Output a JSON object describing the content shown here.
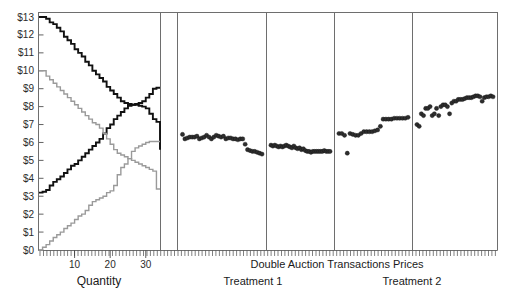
{
  "figure": {
    "title_caption": "Double Auction Transactions Prices",
    "treatment_left_label": "Treatment 1",
    "treatment_right_label": "Treatment 2",
    "quantity_axis_title": "Quantity",
    "colors": {
      "curve_black": "#111111",
      "curve_gray": "#9a9a9a",
      "point": "#2e2e2e",
      "frame": "#6e6e6e",
      "background": "#ffffff"
    }
  },
  "chart_data": {
    "type": "scatter",
    "title": "Double Auction Transactions Prices",
    "xlabel": "Quantity",
    "ylabel": "",
    "ylim": [
      0,
      13
    ],
    "grid": false,
    "legend": "none",
    "ytick_labels": [
      "$0",
      "$1",
      "$2",
      "$3",
      "$4",
      "$5",
      "$6",
      "$7",
      "$8",
      "$9",
      "$10",
      "$11",
      "$12",
      "$13"
    ],
    "ytick_values": [
      0,
      1,
      2,
      3,
      4,
      5,
      6,
      7,
      8,
      9,
      10,
      11,
      12,
      13
    ],
    "supply_demand_panel": {
      "type": "line",
      "xlabel": "Quantity",
      "xtick_labels": [
        "10",
        "20",
        "30"
      ],
      "xtick_values": [
        10,
        20,
        30
      ],
      "xlim": [
        0,
        34
      ],
      "series": [
        {
          "name": "Demand (black, treatment 1)",
          "color": "#111111",
          "style": "step",
          "x": [
            0,
            1,
            2,
            3,
            4,
            5,
            6,
            7,
            8,
            9,
            10,
            11,
            12,
            13,
            14,
            15,
            16,
            17,
            18,
            19,
            20,
            21,
            22,
            23,
            24,
            25,
            26,
            27,
            28,
            29,
            30,
            31,
            32,
            33
          ],
          "y": [
            13.0,
            13.0,
            12.9,
            12.7,
            12.6,
            12.4,
            12.2,
            11.9,
            11.7,
            11.5,
            11.2,
            11.0,
            10.8,
            10.5,
            10.3,
            10.0,
            9.8,
            9.6,
            9.4,
            9.1,
            8.9,
            8.7,
            8.5,
            8.3,
            8.2,
            8.15,
            8.1,
            8.1,
            8.05,
            8.0,
            7.9,
            7.6,
            7.3,
            7.15
          ]
        },
        {
          "name": "Supply (black, treatment 1)",
          "color": "#111111",
          "style": "step",
          "x": [
            0,
            1,
            2,
            3,
            4,
            5,
            6,
            7,
            8,
            9,
            10,
            11,
            12,
            13,
            14,
            15,
            16,
            17,
            18,
            19,
            20,
            21,
            22,
            23,
            24,
            25,
            26,
            27,
            28,
            29,
            30,
            31,
            32,
            33
          ],
          "y": [
            3.2,
            3.25,
            3.35,
            3.6,
            3.8,
            3.95,
            4.1,
            4.3,
            4.5,
            4.7,
            4.8,
            5.0,
            5.2,
            5.4,
            5.6,
            5.8,
            6.0,
            6.2,
            6.5,
            6.8,
            7.0,
            7.3,
            7.5,
            7.7,
            7.9,
            8.05,
            8.1,
            8.15,
            8.2,
            8.3,
            8.5,
            8.7,
            9.0,
            9.05
          ]
        },
        {
          "name": "Demand (gray, treatment 2)",
          "color": "#9a9a9a",
          "style": "step",
          "x": [
            0,
            1,
            2,
            3,
            4,
            5,
            6,
            7,
            8,
            9,
            10,
            11,
            12,
            13,
            14,
            15,
            16,
            17,
            18,
            19,
            20,
            21,
            22,
            23,
            24,
            25,
            26,
            27,
            28,
            29,
            30,
            31,
            32,
            33
          ],
          "y": [
            10.0,
            10.0,
            9.7,
            9.5,
            9.3,
            9.1,
            8.9,
            8.7,
            8.5,
            8.3,
            8.1,
            7.9,
            7.7,
            7.5,
            7.3,
            7.1,
            7.0,
            6.8,
            6.5,
            6.2,
            5.9,
            5.6,
            5.4,
            5.3,
            5.2,
            5.1,
            5.0,
            4.9,
            4.8,
            4.7,
            4.6,
            4.5,
            4.4,
            3.4
          ]
        },
        {
          "name": "Supply (gray, treatment 2)",
          "color": "#9a9a9a",
          "style": "step",
          "x": [
            0,
            1,
            2,
            3,
            4,
            5,
            6,
            7,
            8,
            9,
            10,
            11,
            12,
            13,
            14,
            15,
            16,
            17,
            18,
            19,
            20,
            21,
            22,
            23,
            24,
            25,
            26,
            27,
            28,
            29,
            30,
            31,
            32,
            33
          ],
          "y": [
            0.0,
            0.15,
            0.3,
            0.5,
            0.7,
            0.85,
            1.0,
            1.2,
            1.35,
            1.5,
            1.7,
            1.9,
            2.0,
            2.2,
            2.5,
            2.7,
            2.8,
            2.9,
            3.0,
            3.2,
            3.3,
            3.6,
            4.2,
            4.6,
            4.8,
            5.1,
            5.5,
            5.7,
            5.8,
            5.9,
            6.0,
            6.05,
            6.05,
            6.05
          ]
        }
      ]
    },
    "transaction_panels": [
      {
        "panel": 1,
        "group": "Treatment 1",
        "prices": [
          6.45,
          6.2,
          6.25,
          6.3,
          6.3,
          6.3,
          6.35,
          6.2,
          6.25,
          6.3,
          6.4,
          6.3,
          6.2,
          6.3,
          6.4,
          6.35,
          6.3,
          6.35,
          6.2,
          6.25,
          6.25,
          6.2,
          6.2,
          6.15,
          6.2,
          6.2,
          5.9,
          5.6,
          5.55,
          5.5,
          5.5,
          5.45,
          5.4,
          5.35
        ]
      },
      {
        "panel": 2,
        "group": "Treatment 1",
        "prices": [
          5.85,
          5.8,
          5.85,
          5.8,
          5.75,
          5.8,
          5.75,
          5.8,
          5.85,
          5.8,
          5.75,
          5.7,
          5.8,
          5.7,
          5.65,
          5.7,
          5.6,
          5.65,
          5.55,
          5.5,
          5.5,
          5.45,
          5.5,
          5.5,
          5.5,
          5.5,
          5.5,
          5.5,
          5.55,
          5.5,
          5.5,
          5.5
        ]
      },
      {
        "panel": 3,
        "group": "Treatment 2",
        "prices": [
          6.5,
          6.5,
          6.4,
          5.4,
          6.5,
          6.45,
          6.4,
          6.4,
          6.5,
          6.6,
          6.6,
          6.6,
          6.6,
          6.65,
          6.7,
          6.9,
          7.3,
          7.3,
          7.3,
          7.3,
          7.35,
          7.35,
          7.35,
          7.35,
          7.35,
          7.4
        ]
      },
      {
        "panel": 4,
        "group": "Treatment 2",
        "prices": [
          7.0,
          6.9,
          7.6,
          7.5,
          7.9,
          7.9,
          8.0,
          7.5,
          7.6,
          7.9,
          7.5,
          8.0,
          8.1,
          8.1,
          8.0,
          7.6,
          8.2,
          8.3,
          8.3,
          8.4,
          8.4,
          8.4,
          8.45,
          8.5,
          8.5,
          8.5,
          8.55,
          8.6,
          8.6,
          8.55,
          8.3,
          8.5,
          8.55,
          8.55,
          8.6,
          8.55
        ]
      }
    ]
  }
}
